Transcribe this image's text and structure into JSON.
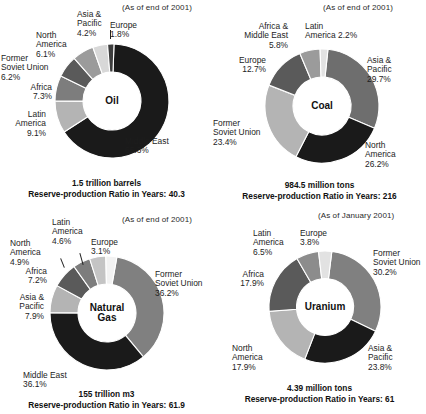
{
  "panels": [
    {
      "id": "oil",
      "center_label": "Oil",
      "asof": "(As of end of 2001)",
      "caption_line1": "1.5 trillion barrels",
      "caption_line2": "Reserve-production Ratio in Years: 40.3",
      "labels": {
        "middle_east": "Middle East",
        "middle_east_pct": "65.3%",
        "latin_america": "Latin",
        "latin_america2": "America",
        "latin_america_pct": "9.1%",
        "africa": "Africa",
        "africa_pct": "7.3%",
        "fsu": "Former",
        "fsu2": "Soviet Union",
        "fsu_pct": "6.2%",
        "north_america": "North",
        "north_america2": "America",
        "north_america_pct": "6.1%",
        "asia_pacific": "Asia &",
        "asia_pacific2": "Pacific",
        "asia_pacific_pct": "4.2%",
        "europe": "Europe",
        "europe_pct": "1.8%"
      }
    },
    {
      "id": "coal",
      "center_label": "Coal",
      "asof": "(As of end of 2001)",
      "caption_line1": "984.5 million tons",
      "caption_line2": "Reserve-production Ratio in Years: 216",
      "labels": {
        "asia_pacific": "Asia &",
        "asia_pacific2": "Pacific",
        "asia_pacific_pct": "29.7%",
        "north_america": "North",
        "north_america2": "America",
        "north_america_pct": "26.2%",
        "fsu": "Former",
        "fsu2": "Soviet Union",
        "fsu_pct": "23.4%",
        "europe": "Europe",
        "europe_pct": "12.7%",
        "africa_me": "Africa &",
        "africa_me2": "Middle East",
        "africa_me_pct": "5.8%",
        "latin_america": "Latin",
        "latin_america2": "America 2.2%"
      }
    },
    {
      "id": "natural-gas",
      "center_label_line1": "Natural",
      "center_label_line2": "Gas",
      "asof": "(As of end of 2001)",
      "caption_line1": "155 trillion m3",
      "caption_line2": "Reserve-production Ratio in Years: 61.9",
      "labels": {
        "fsu": "Former",
        "fsu2": "Soviet Union",
        "fsu_pct": "36.2%",
        "middle_east": "Middle East",
        "middle_east_pct": "36.1%",
        "asia_pacific": "Asia &",
        "asia_pacific2": "Pacific",
        "asia_pacific_pct": "7.9%",
        "africa": "Africa",
        "africa_pct": "7.2%",
        "north_america": "North",
        "north_america2": "America",
        "north_america_pct": "4.9%",
        "latin_america": "Latin",
        "latin_america2": "America",
        "latin_america_pct": "4.6%",
        "europe": "Europe",
        "europe_pct": "3.1%"
      }
    },
    {
      "id": "uranium",
      "center_label": "Uranium",
      "asof": "(As of January 2001)",
      "caption_line1": "4.39 million tons",
      "caption_line2": "Reserve-production Ratio in Years: 61",
      "labels": {
        "fsu": "Former",
        "fsu2": "Soviet Union",
        "fsu_pct": "30.2%",
        "asia_pacific": "Asia &",
        "asia_pacific2": "Pacific",
        "asia_pacific_pct": "23.8%",
        "north_america": "North",
        "north_america2": "America",
        "north_america_pct": "17.9%",
        "africa": "Africa",
        "africa_pct": "17.9%",
        "latin_america": "Latin",
        "latin_america2": "America",
        "latin_america_pct": "6.5%",
        "europe": "Europe",
        "europe_pct": "3.8%"
      }
    }
  ],
  "chart_data": [
    {
      "type": "pie",
      "title": "Oil",
      "subtitle": "(As of end of 2001)",
      "total": "1.5 trillion barrels",
      "reserve_production_ratio_years": 40.3,
      "legend": "none",
      "categories": [
        "Middle East",
        "Latin America",
        "Africa",
        "Former Soviet Union",
        "North America",
        "Asia & Pacific",
        "Europe"
      ],
      "values": [
        65.3,
        9.1,
        7.3,
        6.2,
        6.1,
        4.2,
        1.8
      ],
      "units": "%",
      "colors": [
        "#1a1a1a",
        "#b4b4b4",
        "#7d7d7d",
        "#5a5a5a",
        "#9b9b9b",
        "#d8d8d8",
        "#3d3d3d"
      ]
    },
    {
      "type": "pie",
      "title": "Coal",
      "subtitle": "(As of end of 2001)",
      "total": "984.5 million tons",
      "reserve_production_ratio_years": 216,
      "legend": "none",
      "categories": [
        "Asia & Pacific",
        "North America",
        "Former Soviet Union",
        "Europe",
        "Africa & Middle East",
        "Latin America"
      ],
      "values": [
        29.7,
        26.2,
        23.4,
        12.7,
        5.8,
        2.2
      ],
      "units": "%",
      "colors": [
        "#6e6e6e",
        "#1a1a1a",
        "#b4b4b4",
        "#5a5a5a",
        "#9b9b9b",
        "#e2e2e2"
      ]
    },
    {
      "type": "pie",
      "title": "Natural Gas",
      "subtitle": "(As of end of 2001)",
      "total": "155 trillion m3",
      "reserve_production_ratio_years": 61.9,
      "legend": "none",
      "categories": [
        "Former Soviet Union",
        "Middle East",
        "Asia & Pacific",
        "Africa",
        "North America",
        "Latin America",
        "Europe"
      ],
      "values": [
        36.2,
        36.1,
        7.9,
        7.2,
        4.9,
        4.6,
        3.1
      ],
      "units": "%",
      "colors": [
        "#808080",
        "#1a1a1a",
        "#b4b4b4",
        "#5a5a5a",
        "#7d7d7d",
        "#c4c4c4",
        "#f2f2f2"
      ]
    },
    {
      "type": "pie",
      "title": "Uranium",
      "subtitle": "(As of January 2001)",
      "total": "4.39 million tons",
      "reserve_production_ratio_years": 61,
      "legend": "none",
      "categories": [
        "Former Soviet Union",
        "Asia & Pacific",
        "North America",
        "Africa",
        "Latin America",
        "Europe"
      ],
      "values": [
        30.2,
        23.8,
        17.9,
        17.9,
        6.5,
        3.8
      ],
      "units": "%",
      "colors": [
        "#808080",
        "#1a1a1a",
        "#b4b4b4",
        "#5a5a5a",
        "#8c8c8c",
        "#e2e2e2"
      ]
    }
  ]
}
